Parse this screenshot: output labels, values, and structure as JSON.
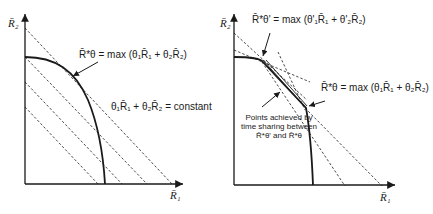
{
  "left_panel": {
    "y_axis_label": "R̄₂",
    "x_axis_label": "R̄₁",
    "optimum_label": "R̄*θ = max (θ₁R̄₁ + θ₂R̄₂)",
    "line_label": "θ₁R̄₁ + θ₂R̄₂ = constant"
  },
  "right_panel": {
    "y_axis_label": "R̄₂",
    "x_axis_label": "R̄₁",
    "optimum_label_prime": "R̄*θ' = max (θ'₁R̄₁ + θ'₂R̄₂)",
    "optimum_label": "R̄*θ = max (θ₁R̄₁ + θ₂R̄₂)",
    "time_sharing_caption_line1": "Points achieved by",
    "time_sharing_caption_line2": "time sharing between",
    "time_sharing_caption_line3": "R̄*θ' and R̄*θ"
  },
  "colors": {
    "ink": "#1a1a1a",
    "background": "#ffffff"
  }
}
